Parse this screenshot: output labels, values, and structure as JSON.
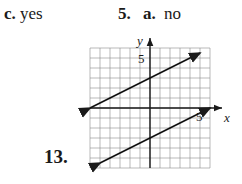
{
  "answers": {
    "c": {
      "label": "c.",
      "value": "yes"
    },
    "q5": {
      "number": "5.",
      "part": "a.",
      "value": "no"
    }
  },
  "problem13": {
    "number": "13."
  },
  "chart_data": {
    "type": "line",
    "title": "",
    "xlabel": "x",
    "ylabel": "y",
    "xlim": [
      -6,
      6
    ],
    "ylim": [
      -6,
      6
    ],
    "grid": true,
    "tick_labels": {
      "x": [
        "5"
      ],
      "y": [
        "5"
      ]
    },
    "series": [
      {
        "name": "upper line",
        "equation": "y = 0.5x + 3",
        "x": [
          -6,
          5
        ],
        "y": [
          0,
          5.5
        ]
      },
      {
        "name": "lower line",
        "equation": "y = 0.5x - 3",
        "x": [
          -5,
          6
        ],
        "y": [
          -5.5,
          0
        ]
      }
    ]
  }
}
